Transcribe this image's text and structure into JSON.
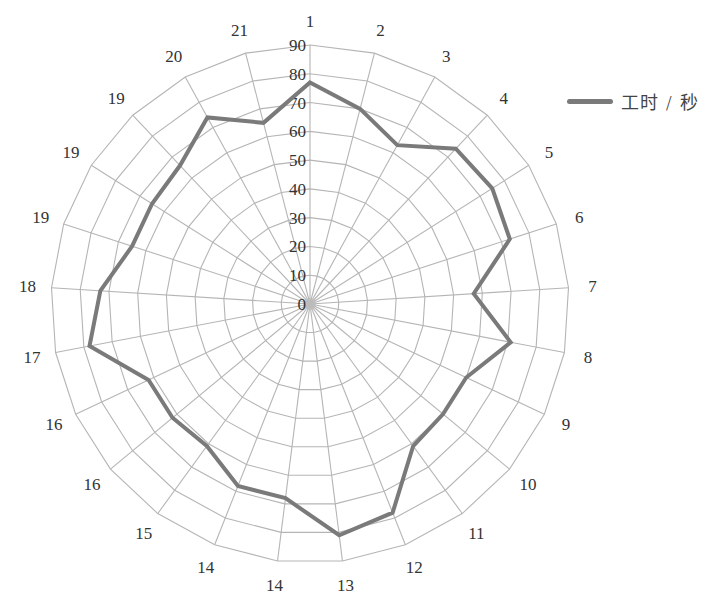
{
  "chart_data": {
    "type": "radar",
    "title": "",
    "categories": [
      "1",
      "2",
      "3",
      "4",
      "5",
      "6",
      "7",
      "8",
      "9",
      "10",
      "11",
      "12",
      "13",
      "14",
      "14",
      "15",
      "16",
      "16",
      "17",
      "18",
      "19",
      "19",
      "19",
      "20",
      "21"
    ],
    "series": [
      {
        "name": "工时 / 秒",
        "color": "#7a7a7a",
        "values": [
          77,
          70,
          63,
          74,
          75,
          73,
          57,
          71,
          60,
          60,
          61,
          78,
          81,
          68,
          68,
          61,
          62,
          62,
          78,
          73,
          65,
          65,
          66,
          74,
          65
        ]
      }
    ],
    "radial_axis": {
      "min": 0,
      "max": 90,
      "step": 10,
      "tick_labels": [
        "0",
        "10",
        "20",
        "30",
        "40",
        "50",
        "60",
        "70",
        "80",
        "90"
      ]
    },
    "grid": true,
    "legend_position": "right"
  },
  "legend": {
    "label": "工时 / 秒",
    "color": "#7a7a7a"
  },
  "style": {
    "grid_color": "#b5b5b5",
    "text_color": "#333333"
  }
}
